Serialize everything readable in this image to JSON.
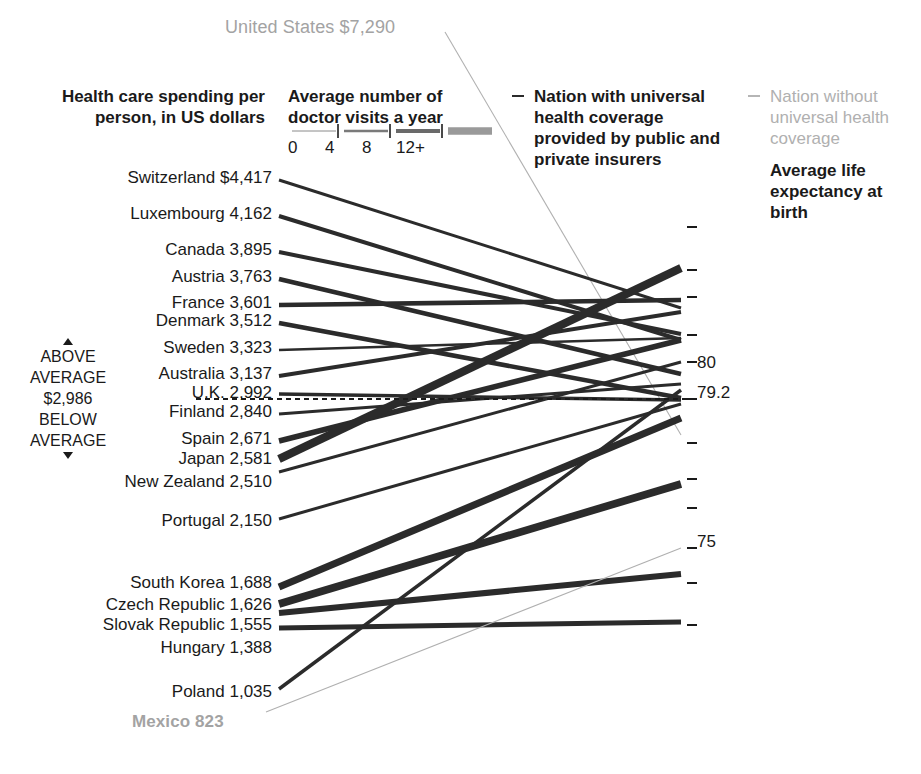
{
  "annotations": {
    "us_label": "United States $7,290",
    "mexico_label": "Mexico 823",
    "spending_title": "Health care spending per person, in US dollars",
    "visits_title": "Average number of doctor visits a year",
    "legend_universal": "Nation with universal health coverage provided by public and private insurers",
    "legend_no_universal": "Nation without universal health coverage",
    "life_title": "Average life expectancy at birth",
    "above": "ABOVE",
    "average_top": "AVERAGE",
    "average_value": "$2,986",
    "below": "BELOW",
    "average_bottom": "AVERAGE"
  },
  "visits_legend": {
    "ticks": [
      "0",
      "4",
      "8",
      "12+"
    ]
  },
  "axis_labels": [
    {
      "text": "80",
      "y": 362
    },
    {
      "text": "79.2",
      "y": 392
    },
    {
      "text": "75",
      "y": 541
    }
  ],
  "axis_ticks_y": [
    227,
    270,
    297,
    335,
    362,
    399,
    443,
    479,
    508,
    548,
    583,
    625
  ],
  "colors": {
    "universal": "#2b2b2b",
    "no_universal": "#b0b0b0",
    "text": "#1a1a1a",
    "muted_text": "#a3a3a3",
    "average_dash": "#1a1a1a"
  },
  "chart_data": {
    "type": "line",
    "title": "Health care spending per person, in US dollars",
    "xlabel": "",
    "ylabel": "Average life expectancy at birth",
    "legend": [
      "Nation with universal health coverage provided by public and private insurers",
      "Nation without universal health coverage"
    ],
    "average_spending": 2986,
    "average_life_expectancy": 79.2,
    "right_axis_ticks": [
      80,
      79.2,
      75
    ],
    "series": [
      {
        "name": "United States",
        "spending": 7290,
        "spending_text": "United States $7,290",
        "universal": false,
        "visits": 4,
        "label_x": 225,
        "label_y": 26,
        "left_y": 32,
        "right_y": 435
      },
      {
        "name": "Switzerland",
        "spending": 4417,
        "spending_text": "Switzerland $4,417",
        "universal": true,
        "visits": 4,
        "label_x": 0,
        "label_y": 178,
        "left_y": 180,
        "right_y": 308
      },
      {
        "name": "Luxembourg",
        "spending": 4162,
        "spending_text": "Luxembourg 4,162",
        "universal": true,
        "visits": 6,
        "label_x": 0,
        "label_y": 214,
        "left_y": 216,
        "right_y": 340
      },
      {
        "name": "Canada",
        "spending": 3895,
        "spending_text": "Canada 3,895",
        "universal": true,
        "visits": 6,
        "label_x": 0,
        "label_y": 250,
        "left_y": 252,
        "right_y": 334
      },
      {
        "name": "Austria",
        "spending": 3763,
        "spending_text": "Austria 3,763",
        "universal": true,
        "visits": 7,
        "label_x": 0,
        "label_y": 277,
        "left_y": 279,
        "right_y": 374
      },
      {
        "name": "France",
        "spending": 3601,
        "spending_text": "France 3,601",
        "universal": true,
        "visits": 7,
        "label_x": 0,
        "label_y": 303,
        "left_y": 305,
        "right_y": 300
      },
      {
        "name": "Denmark",
        "spending": 3512,
        "spending_text": "Denmark 3,512",
        "universal": true,
        "visits": 7,
        "label_x": 0,
        "label_y": 321,
        "left_y": 323,
        "right_y": 398
      },
      {
        "name": "Sweden",
        "spending": 3323,
        "spending_text": "Sweden 3,323",
        "universal": true,
        "visits": 3,
        "label_x": 0,
        "label_y": 348,
        "left_y": 350,
        "right_y": 338
      },
      {
        "name": "Australia",
        "spending": 3137,
        "spending_text": "Australia 3,137",
        "universal": true,
        "visits": 6,
        "label_x": 0,
        "label_y": 374,
        "left_y": 376,
        "right_y": 312
      },
      {
        "name": "U.K.",
        "spending": 2992,
        "spending_text": "U.K. 2,992",
        "universal": true,
        "visits": 5,
        "label_x": 0,
        "label_y": 393,
        "left_y": 394,
        "right_y": 400
      },
      {
        "name": "Finland",
        "spending": 2840,
        "spending_text": "Finland 2,840",
        "universal": true,
        "visits": 4,
        "label_x": 0,
        "label_y": 412,
        "left_y": 414,
        "right_y": 384
      },
      {
        "name": "Spain",
        "spending": 2671,
        "spending_text": "Spain 2,671",
        "universal": true,
        "visits": 9,
        "label_x": 0,
        "label_y": 439,
        "left_y": 441,
        "right_y": 340
      },
      {
        "name": "Japan",
        "spending": 2581,
        "spending_text": "Japan 2,581",
        "universal": true,
        "visits": 14,
        "label_x": 0,
        "label_y": 459,
        "left_y": 459,
        "right_y": 268
      },
      {
        "name": "New Zealand",
        "spending": 2510,
        "spending_text": "New Zealand 2,510",
        "universal": true,
        "visits": 4,
        "label_x": 0,
        "label_y": 482,
        "left_y": 472,
        "right_y": 362
      },
      {
        "name": "Portugal",
        "spending": 2150,
        "spending_text": "Portugal 2,150",
        "universal": true,
        "visits": 4,
        "label_x": 0,
        "label_y": 521,
        "left_y": 519,
        "right_y": 404
      },
      {
        "name": "South Korea",
        "spending": 1688,
        "spending_text": "South Korea 1,688",
        "universal": true,
        "visits": 12,
        "label_x": 0,
        "label_y": 583,
        "left_y": 587,
        "right_y": 418
      },
      {
        "name": "Czech Republic",
        "spending": 1626,
        "spending_text": "Czech Republic 1,626",
        "universal": true,
        "visits": 13,
        "label_x": 0,
        "label_y": 605,
        "left_y": 604,
        "right_y": 484
      },
      {
        "name": "Slovak Republic",
        "spending": 1555,
        "spending_text": "Slovak Republic 1,555",
        "universal": true,
        "visits": 10,
        "label_x": 0,
        "label_y": 625,
        "left_y": 613,
        "right_y": 574
      },
      {
        "name": "Hungary",
        "spending": 1388,
        "spending_text": "Hungary 1,388",
        "universal": true,
        "visits": 8,
        "label_x": 0,
        "label_y": 648,
        "left_y": 628,
        "right_y": 622
      },
      {
        "name": "Poland",
        "spending": 1035,
        "spending_text": "Poland 1,035",
        "universal": true,
        "visits": 5,
        "label_x": 0,
        "label_y": 692,
        "left_y": 689,
        "right_y": 390
      },
      {
        "name": "Mexico",
        "spending": 823,
        "spending_text": "Mexico 823",
        "universal": false,
        "visits": 2,
        "label_x": 132,
        "label_y": 721,
        "left_y": 712,
        "right_y": 548
      }
    ]
  }
}
